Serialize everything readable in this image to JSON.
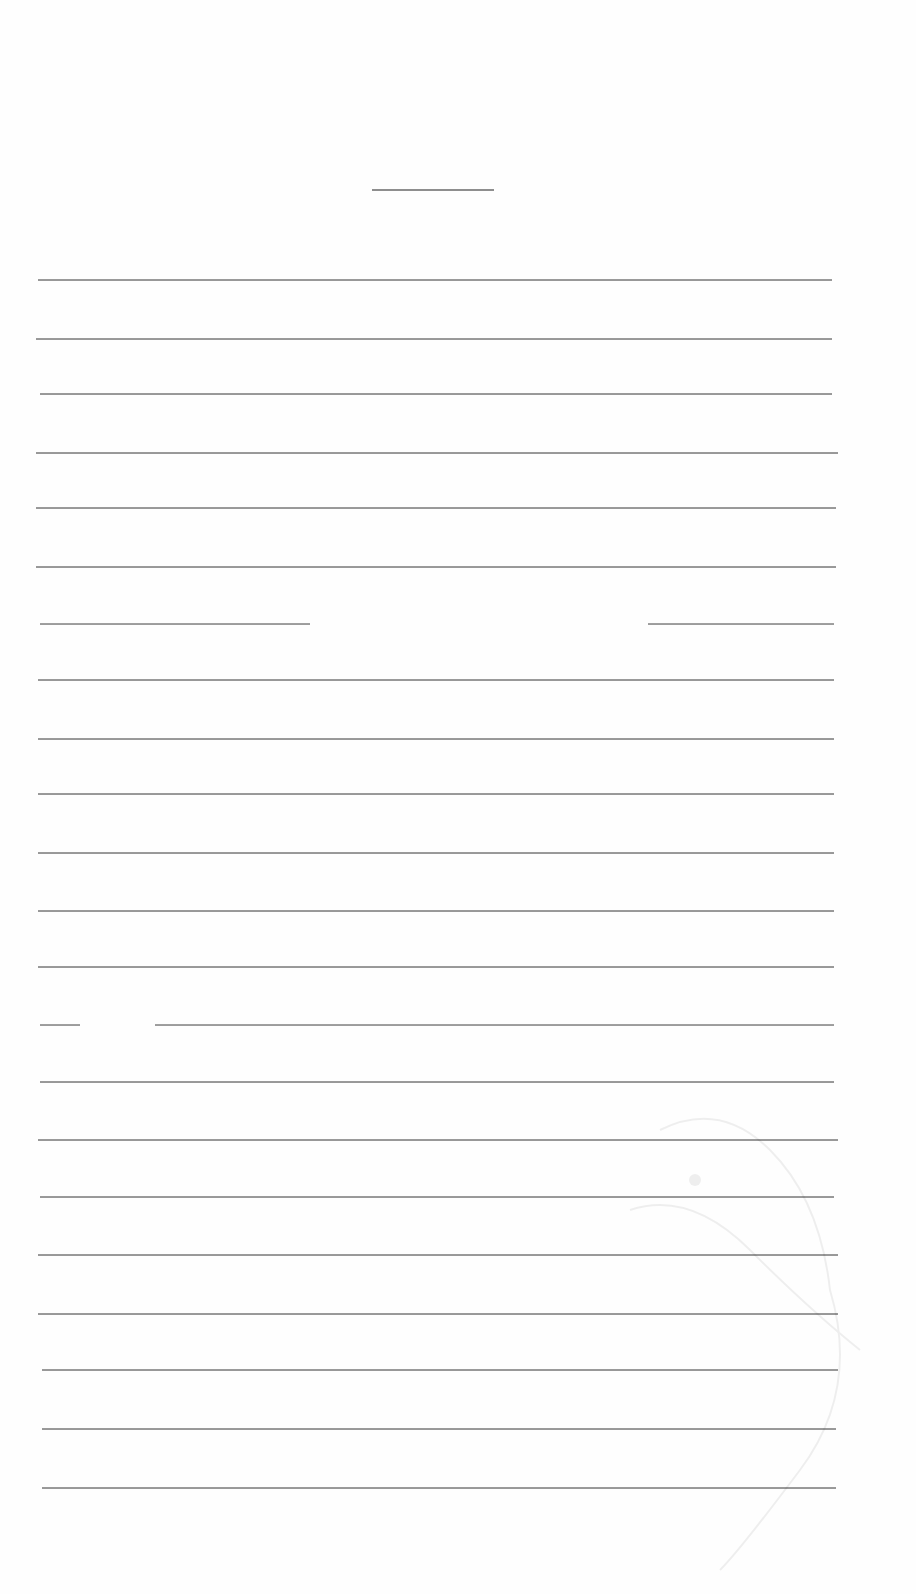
{
  "document": {
    "type": "blank lined sheet",
    "title_rule": {
      "x1": 372,
      "x2": 494,
      "y": 189
    },
    "line_color": "#9a9a9a",
    "rules": [
      {
        "y": 279,
        "x1": 38,
        "x2": 832
      },
      {
        "y": 338,
        "x1": 36,
        "x2": 832
      },
      {
        "y": 393,
        "x1": 40,
        "x2": 832
      },
      {
        "y": 452,
        "x1": 36,
        "x2": 838
      },
      {
        "y": 507,
        "x1": 36,
        "x2": 836
      },
      {
        "y": 566,
        "x1": 36,
        "x2": 836
      },
      {
        "y": 623,
        "segments": [
          {
            "x1": 40,
            "x2": 310
          },
          {
            "x1": 648,
            "x2": 834
          }
        ]
      },
      {
        "y": 679,
        "x1": 38,
        "x2": 834
      },
      {
        "y": 738,
        "x1": 38,
        "x2": 834
      },
      {
        "y": 793,
        "x1": 38,
        "x2": 834
      },
      {
        "y": 852,
        "x1": 38,
        "x2": 834
      },
      {
        "y": 910,
        "x1": 38,
        "x2": 834
      },
      {
        "y": 966,
        "x1": 38,
        "x2": 834
      },
      {
        "y": 1024,
        "segments": [
          {
            "x1": 40,
            "x2": 80
          },
          {
            "x1": 155,
            "x2": 834
          }
        ]
      },
      {
        "y": 1081,
        "x1": 40,
        "x2": 834
      },
      {
        "y": 1139,
        "x1": 38,
        "x2": 838
      },
      {
        "y": 1196,
        "x1": 40,
        "x2": 834
      },
      {
        "y": 1254,
        "x1": 38,
        "x2": 838
      },
      {
        "y": 1313,
        "x1": 38,
        "x2": 838
      },
      {
        "y": 1369,
        "x1": 42,
        "x2": 838
      },
      {
        "y": 1428,
        "x1": 42,
        "x2": 836
      },
      {
        "y": 1487,
        "x1": 42,
        "x2": 836
      }
    ]
  }
}
